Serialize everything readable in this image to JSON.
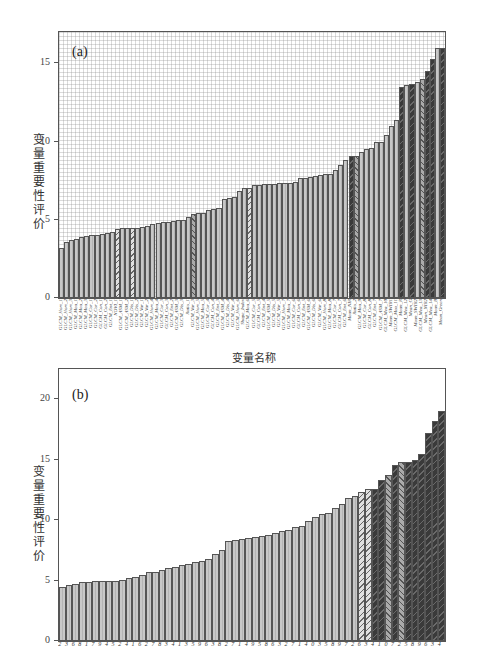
{
  "chart_data": [
    {
      "panel": "(a)",
      "type": "bar",
      "title": "",
      "xlabel": "变量名称",
      "ylabel": "变量重要性评价",
      "ylim": [
        0,
        17
      ],
      "yticks": [
        0,
        5,
        10,
        15
      ],
      "grid": true,
      "legend": null,
      "categories": [
        "GLCM_Hom_1",
        "GLCM_Hom_2",
        "GLCM_Hom_3",
        "GLCM_Mea_1",
        "GLCM_Mea_2",
        "GLCM_Mea_3",
        "GLCM_Cor_1",
        "GLCM_Cor_2",
        "GLCM_Con_1",
        "GLCM_Con_2",
        "GLCM_Ent_1",
        "NDVI_1",
        "GLCM_ASM_1",
        "GLCM_ASM_2",
        "GLCM_Dis_1",
        "GLCM_Dis_2",
        "GLCM_Var_1",
        "GLCM_Var_2",
        "GLCM_Hom_4",
        "GLCM_Mea_4",
        "GLCM_Cor_3",
        "GLCM_Con_3",
        "GLCM_Ent_2",
        "GLCM_ASM_3",
        "GLCM_Dis_3",
        "Ratio_1",
        "GLCM_Var_3",
        "GLCM_Hom_5",
        "GLCM_Mea_5",
        "GLCM_Cor_4",
        "GLCM_Con_4",
        "GLCM_Ent_3",
        "GLCM_ASM_4",
        "GLCM_Dis_4",
        "GLCM_Var_4",
        "GLCM_Hom_6",
        "Shape_Index",
        "GLCM_Mea_6",
        "GLCM_Cor_5",
        "GLCM_Con_5",
        "GLCM_Ent_4",
        "GLCM_ASM_5",
        "GLCM_Dis_5",
        "GLCM_Var_5",
        "GLCM_Hom_7",
        "GLCM_Mea_7",
        "GLCM_Cor_6",
        "GLCM_Con_6",
        "GLCM_Ent_5",
        "GLCM_ASM_6",
        "GLCM_Dis_6",
        "GLCM_Var_6",
        "GLCM_Hom_8",
        "GLCM_Mea_8",
        "GLCM_Cor_7",
        "GLCM_Con_7",
        "GLCM_Ent_6",
        "Mean_NIR",
        "Ratio_2",
        "GLCM_Mea_9",
        "GLCM_Cor_8",
        "GLCM_Con_8",
        "GLCM_Ent_7",
        "GLCM_ASM_7",
        "GLCM_Mea_10",
        "Mean_SWIR1",
        "GLCM_Mea_11",
        "Mean_R",
        "GLCM_Mea_12",
        "Mean_G",
        "Mean_SWIR2",
        "GLCM_Mea_13",
        "Mean_NIR2",
        "GLCM_Mea_14",
        "Mean_B",
        "Mean_Green"
      ],
      "values": [
        3.2,
        3.6,
        3.7,
        3.8,
        3.9,
        3.95,
        4.0,
        4.0,
        4.1,
        4.15,
        4.2,
        4.4,
        4.45,
        4.5,
        4.5,
        4.5,
        4.55,
        4.6,
        4.75,
        4.8,
        4.85,
        4.85,
        4.9,
        5.0,
        5.0,
        5.2,
        5.4,
        5.45,
        5.45,
        5.65,
        5.7,
        5.75,
        6.35,
        6.4,
        6.45,
        6.85,
        7.0,
        7.05,
        7.2,
        7.25,
        7.3,
        7.3,
        7.3,
        7.35,
        7.35,
        7.35,
        7.4,
        7.65,
        7.7,
        7.75,
        7.8,
        7.85,
        7.9,
        7.9,
        8.2,
        8.5,
        8.85,
        9.05,
        9.1,
        9.3,
        9.55,
        9.6,
        9.95,
        10.0,
        10.4,
        11.0,
        11.4,
        13.5,
        13.6,
        13.7,
        13.8,
        14.0,
        14.5,
        15.3,
        16.0,
        16.0
      ],
      "styles": [
        "light",
        "light",
        "light",
        "light",
        "light",
        "light",
        "light",
        "light",
        "light",
        "light",
        "light",
        "hatch",
        "light",
        "light",
        "hatch",
        "light",
        "light",
        "light",
        "light",
        "light",
        "light",
        "light",
        "light",
        "light",
        "light",
        "light",
        "cross",
        "light",
        "light",
        "light",
        "light",
        "light",
        "light",
        "light",
        "light",
        "light",
        "light",
        "hatch",
        "light",
        "light",
        "light",
        "light",
        "light",
        "light",
        "light",
        "light",
        "light",
        "light",
        "light",
        "light",
        "light",
        "light",
        "light",
        "light",
        "light",
        "light",
        "light",
        "dark",
        "cross",
        "light",
        "light",
        "light",
        "light",
        "light",
        "light",
        "light",
        "light",
        "dark",
        "light",
        "dark",
        "light",
        "cross",
        "dark",
        "dark",
        "light",
        "dark"
      ]
    },
    {
      "panel": "(b)",
      "type": "bar",
      "title": "",
      "xlabel": "",
      "ylabel": "变量重要性评价",
      "ylim": [
        0,
        22.5
      ],
      "yticks": [
        0,
        5,
        10,
        15,
        20
      ],
      "grid": false,
      "legend": null,
      "categories": [
        "2",
        "3",
        "6",
        "8",
        "1",
        "7",
        "9",
        "4",
        "5",
        "2",
        "4",
        "1",
        "6",
        "2",
        "7",
        "8",
        "3",
        "4",
        "1",
        "3",
        "5",
        "9",
        "6",
        "3",
        "8",
        "2",
        "7",
        "1",
        "4",
        "9",
        "5",
        "8",
        "6",
        "3",
        "2",
        "7",
        "1",
        "4",
        "0",
        "3",
        "5",
        "8",
        "9",
        "7",
        "2",
        "6",
        "3",
        "4",
        "1",
        "0",
        "7",
        "2",
        "5",
        "8",
        "9",
        "6",
        "3",
        "4",
        "1",
        "0"
      ],
      "values": [
        4.5,
        4.6,
        4.7,
        4.85,
        4.85,
        4.95,
        5.0,
        5.0,
        5.0,
        5.05,
        5.25,
        5.3,
        5.5,
        5.7,
        5.75,
        5.9,
        6.05,
        6.15,
        6.25,
        6.35,
        6.5,
        6.6,
        6.75,
        7.2,
        7.5,
        8.3,
        8.35,
        8.45,
        8.5,
        8.6,
        8.7,
        8.75,
        8.9,
        9.1,
        9.2,
        9.4,
        9.5,
        9.9,
        10.3,
        10.5,
        10.6,
        11.0,
        11.3,
        11.8,
        12.0,
        12.3,
        12.6,
        12.6,
        13.3,
        13.7,
        14.6,
        14.8,
        14.8,
        15.0,
        15.5,
        17.2,
        18.2,
        19.0
      ],
      "styles": [
        "light",
        "light",
        "light",
        "light",
        "light",
        "light",
        "light",
        "light",
        "light",
        "light",
        "light",
        "light",
        "light",
        "light",
        "light",
        "light",
        "light",
        "light",
        "light",
        "light",
        "light",
        "light",
        "light",
        "light",
        "light",
        "light",
        "light",
        "light",
        "light",
        "light",
        "light",
        "light",
        "light",
        "light",
        "light",
        "light",
        "light",
        "light",
        "light",
        "light",
        "light",
        "light",
        "light",
        "light",
        "light",
        "hatch",
        "hatch",
        "dark",
        "dark",
        "cross",
        "dark",
        "cross",
        "dark",
        "dark",
        "dark",
        "dark",
        "dark",
        "dark"
      ]
    }
  ],
  "panel_a": {
    "label": "(a)",
    "ylabel": "变量重要性评价",
    "xlabel": "变量名称",
    "yticks": [
      "0",
      "5",
      "10",
      "15"
    ]
  },
  "panel_b": {
    "label": "(b)",
    "ylabel": "变量重要性评价",
    "yticks": [
      "0",
      "5",
      "10",
      "15",
      "20"
    ]
  }
}
